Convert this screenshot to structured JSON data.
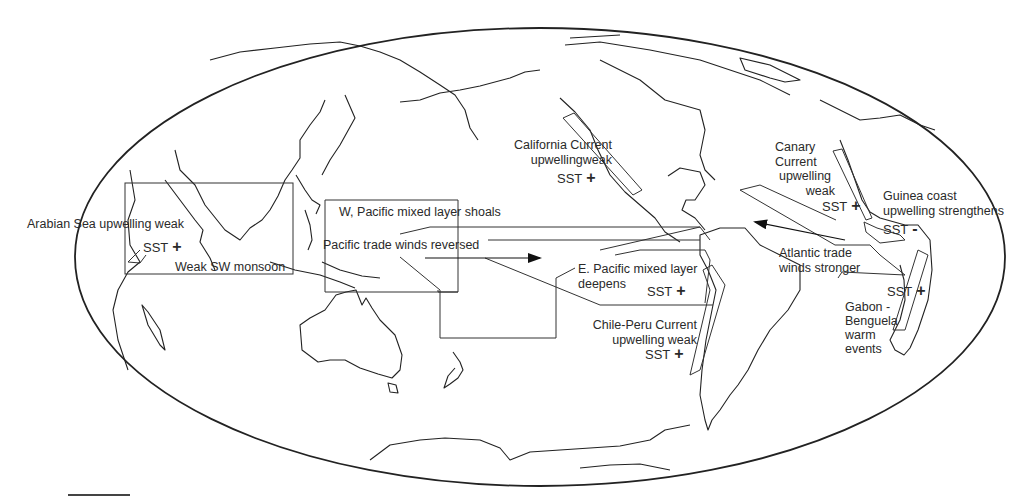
{
  "map": {
    "projection": "world-ellipse",
    "outline_color": "#222222",
    "background": "#ffffff"
  },
  "labels": {
    "arabian_sea": "Arabian Sea upwelling weak",
    "arabian_sst": "SST",
    "arabian_sign": "+",
    "sw_monsoon": "Weak SW monsoon",
    "w_pacific": "W, Pacific mixed layer shoals",
    "pacific_trade": "Pacific trade winds reversed",
    "california_line1": "California Current",
    "california_line2": "upwellingweak",
    "california_sst": "SST",
    "california_sign": "+",
    "e_pacific_line1": "E. Pacific mixed layer",
    "e_pacific_line2": "deepens",
    "e_pacific_sst": "SST",
    "e_pacific_sign": "+",
    "chile_line1": "Chile-Peru Current",
    "chile_line2": "upwelling weak",
    "chile_sst": "SST",
    "chile_sign": "+",
    "canary_line1": "Canary",
    "canary_line2": "Current",
    "canary_line3": "upwelling",
    "canary_line4": "weak",
    "canary_sst": "SST",
    "canary_sign": "+",
    "guinea_line1": "Guinea coast",
    "guinea_line2": "upwelling strengthens",
    "guinea_sst": "SST",
    "guinea_sign": "-",
    "atlantic_line1": "Atlantic trade",
    "atlantic_line2": "winds stronger",
    "gabon_sst": "SST",
    "gabon_sign": "+",
    "gabon_line1": "Gabon -",
    "gabon_line2": "Benguela",
    "gabon_line3": "warm",
    "gabon_line4": "events"
  }
}
